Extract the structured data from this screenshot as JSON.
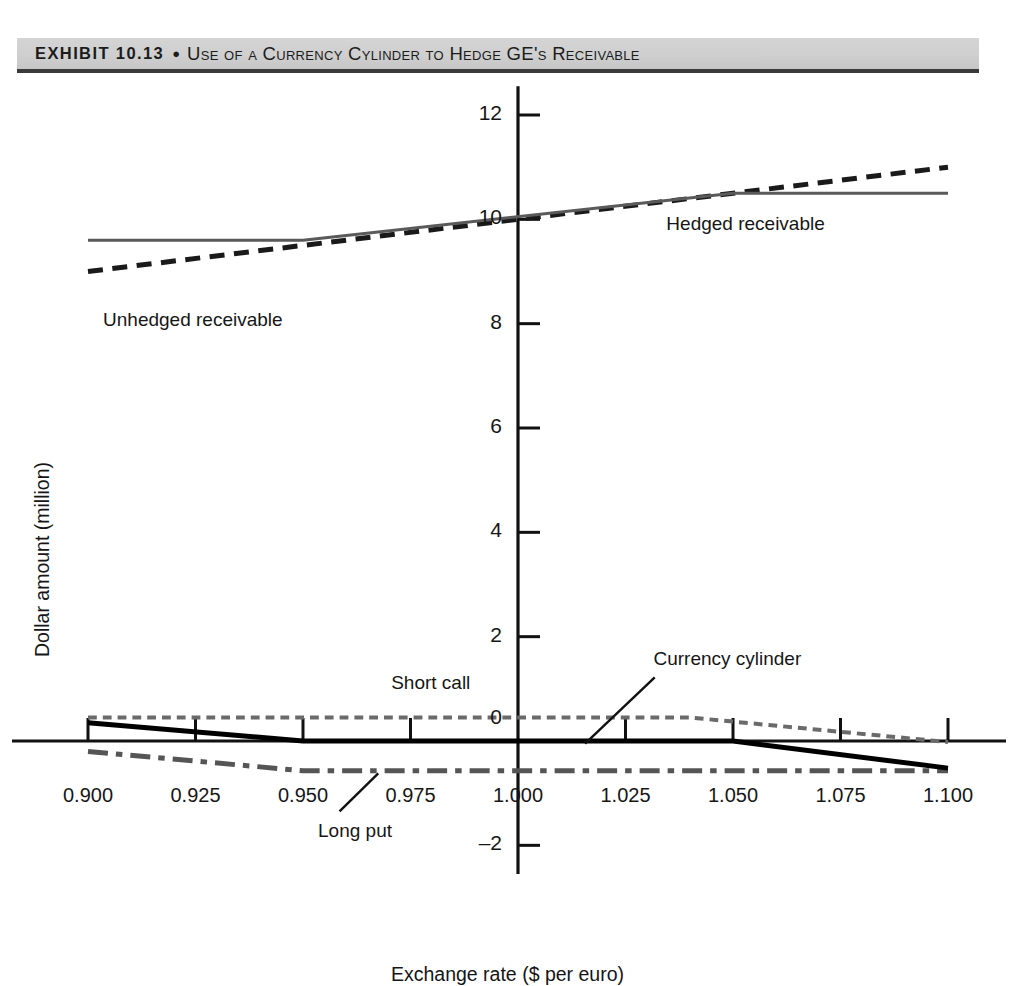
{
  "banner": {
    "exhibit_label": "EXHIBIT 10.13",
    "bullet": "●",
    "title": "Use of a Currency Cylinder to Hedge GE's Receivable"
  },
  "chart_data": {
    "type": "line",
    "title": "Use of a Currency Cylinder to Hedge GE's Receivable",
    "xlabel": "Exchange rate ($ per euro)",
    "ylabel": "Dollar amount (million)",
    "xlim": [
      0.9,
      1.1
    ],
    "ylim": [
      -2.6,
      12.6
    ],
    "xticks": [
      "0.900",
      "0.925",
      "0.950",
      "0.975",
      "1.000",
      "1.025",
      "1.050",
      "1.075",
      "1.100"
    ],
    "xtick_values": [
      0.9,
      0.925,
      0.95,
      0.975,
      1.0,
      1.025,
      1.05,
      1.075,
      1.1
    ],
    "yticks": [
      "12",
      "10",
      "8",
      "6",
      "4",
      "2",
      "0",
      "–2"
    ],
    "ytick_values": [
      12,
      10,
      8,
      6,
      4,
      2,
      0,
      -2
    ],
    "grid": false,
    "legend": "inline-annotations",
    "series": [
      {
        "name": "Unhedged receivable",
        "style": "dashed",
        "color": "#1a1a1a",
        "width": 5,
        "x": [
          0.9,
          1.1
        ],
        "y": [
          9.0,
          11.0
        ]
      },
      {
        "name": "Hedged receivable",
        "style": "solid",
        "color": "#5a5a5a",
        "width": 3,
        "x": [
          0.9,
          0.95,
          1.05,
          1.1
        ],
        "y": [
          9.6,
          9.6,
          10.5,
          10.5
        ]
      },
      {
        "name": "Short call",
        "style": "dotted",
        "color": "#6a6a6a",
        "width": 4,
        "x": [
          0.9,
          1.04,
          1.1
        ],
        "y": [
          0.45,
          0.45,
          -0.02
        ]
      },
      {
        "name": "Long put",
        "style": "dash-dot",
        "color": "#555555",
        "width": 5,
        "x": [
          0.9,
          0.95,
          1.1
        ],
        "y": [
          -0.2,
          -0.57,
          -0.57
        ]
      },
      {
        "name": "Currency cylinder",
        "style": "solid",
        "color": "#000000",
        "width": 5,
        "x": [
          0.9,
          0.95,
          1.05,
          1.1
        ],
        "y": [
          0.35,
          0.0,
          0.0,
          -0.52
        ]
      }
    ],
    "annotations": [
      {
        "text": "Unhedged receivable",
        "x": 0.9035,
        "y": 8.05,
        "anchor": "start"
      },
      {
        "text": "Hedged receivable",
        "x": 1.0345,
        "y": 9.9,
        "anchor": "start"
      },
      {
        "text": "Short call",
        "x": 0.9705,
        "y": 1.1,
        "anchor": "start"
      },
      {
        "text": "Currency cylinder",
        "x": 1.0315,
        "y": 1.55,
        "anchor": "start"
      },
      {
        "text": "Long put",
        "x": 0.9535,
        "y": -1.75,
        "anchor": "start"
      }
    ],
    "leader_lines": [
      {
        "for": "Currency cylinder",
        "x1": 1.0318,
        "y1": 1.22,
        "x2": 1.0156,
        "y2": -0.05
      },
      {
        "for": "Long put",
        "x1": 0.9585,
        "y1": -1.35,
        "x2": 0.9675,
        "y2": -0.62
      }
    ]
  }
}
